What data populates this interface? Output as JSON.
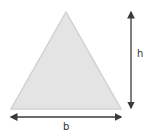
{
  "diagram": {
    "shape": "triangle",
    "fill": "#e4e4e4",
    "stroke": "#d2d2d2",
    "arrow_color": "#3a3a3a",
    "height_label": "h",
    "base_label": "b"
  }
}
